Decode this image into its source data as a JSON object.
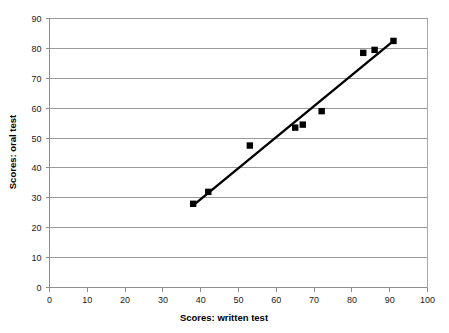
{
  "chart_data": {
    "type": "scatter",
    "title": "",
    "xlabel": "Scores: written test",
    "ylabel": "Scores: oral test",
    "xlim": [
      0,
      100
    ],
    "ylim": [
      0,
      90
    ],
    "xticks": [
      0,
      10,
      20,
      30,
      40,
      50,
      60,
      70,
      80,
      90,
      100
    ],
    "yticks": [
      0,
      10,
      20,
      30,
      40,
      50,
      60,
      70,
      80,
      90
    ],
    "xtick_labels": [
      "0",
      "10",
      "20",
      "30",
      "40",
      "50",
      "60",
      "70",
      "80",
      "90",
      "100"
    ],
    "ytick_labels": [
      "0",
      "10",
      "20",
      "30",
      "40",
      "50",
      "60",
      "70",
      "80",
      "90"
    ],
    "grid": "horizontal",
    "legend": "none",
    "marker": "square",
    "marker_color": "#000000",
    "series": [
      {
        "name": "scores",
        "x": [
          38,
          42,
          53,
          65,
          67,
          72,
          83,
          86,
          91
        ],
        "y": [
          28,
          32,
          47.5,
          53.5,
          54.5,
          59,
          78.5,
          79.5,
          82.5
        ]
      }
    ],
    "trendline": {
      "type": "linear",
      "x": [
        38,
        91
      ],
      "y": [
        27.5,
        82.5
      ],
      "color": "#000000"
    }
  },
  "axes": {
    "x_title": "Scores: written test",
    "y_title": "Scores: oral test"
  }
}
